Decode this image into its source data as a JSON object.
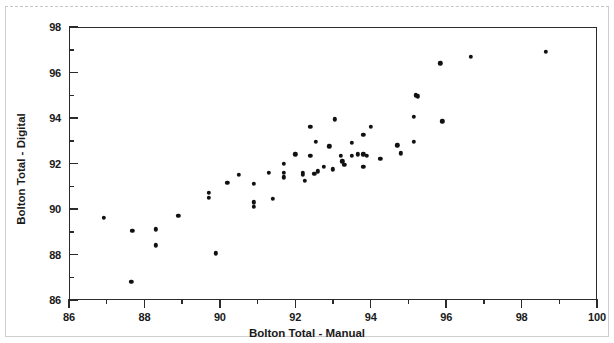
{
  "chart_data": {
    "type": "scatter",
    "title": "",
    "xlabel": "Bolton Total - Manual",
    "ylabel": "Bolton Total - Digital",
    "xlim": [
      86,
      100
    ],
    "ylim": [
      86,
      98
    ],
    "xticks": [
      86,
      88,
      90,
      92,
      94,
      96,
      98,
      100
    ],
    "yticks": [
      86,
      88,
      90,
      92,
      94,
      96,
      98
    ],
    "x_minor_ticks": [
      87,
      89,
      91,
      93,
      95,
      97,
      99
    ],
    "y_minor_ticks": [
      87,
      89,
      91,
      93,
      95,
      97
    ],
    "grid": false,
    "legend": null,
    "marker": "filled-circle",
    "marker_color": "#111111",
    "points": [
      [
        86.93,
        89.6
      ],
      [
        87.65,
        86.8
      ],
      [
        87.68,
        89.05
      ],
      [
        88.3,
        89.1
      ],
      [
        88.3,
        88.4
      ],
      [
        88.9,
        89.7
      ],
      [
        89.7,
        90.7
      ],
      [
        89.7,
        90.5
      ],
      [
        89.9,
        88.05
      ],
      [
        90.2,
        91.15
      ],
      [
        90.5,
        91.5
      ],
      [
        90.9,
        91.1
      ],
      [
        90.9,
        90.3
      ],
      [
        90.9,
        90.1
      ],
      [
        91.3,
        91.6
      ],
      [
        91.4,
        90.45
      ],
      [
        91.7,
        92.0
      ],
      [
        91.7,
        91.6
      ],
      [
        91.7,
        91.4
      ],
      [
        92.0,
        92.4
      ],
      [
        92.2,
        91.5
      ],
      [
        92.2,
        91.6
      ],
      [
        92.25,
        91.25
      ],
      [
        92.4,
        93.6
      ],
      [
        92.4,
        92.35
      ],
      [
        92.5,
        91.55
      ],
      [
        92.55,
        92.95
      ],
      [
        92.6,
        91.65
      ],
      [
        92.75,
        91.85
      ],
      [
        92.9,
        92.75
      ],
      [
        93.0,
        91.75
      ],
      [
        93.05,
        93.95
      ],
      [
        93.2,
        92.35
      ],
      [
        93.25,
        92.1
      ],
      [
        93.3,
        91.95
      ],
      [
        93.5,
        92.9
      ],
      [
        93.5,
        92.35
      ],
      [
        93.65,
        92.4
      ],
      [
        93.8,
        93.25
      ],
      [
        93.8,
        92.4
      ],
      [
        93.8,
        91.85
      ],
      [
        93.9,
        92.35
      ],
      [
        94.0,
        93.6
      ],
      [
        94.25,
        92.2
      ],
      [
        94.7,
        92.8
      ],
      [
        94.8,
        92.45
      ],
      [
        95.15,
        94.05
      ],
      [
        95.15,
        92.95
      ],
      [
        95.2,
        95.0
      ],
      [
        95.25,
        94.95
      ],
      [
        95.85,
        96.4
      ],
      [
        95.9,
        93.85
      ],
      [
        96.65,
        96.7
      ],
      [
        98.65,
        96.9
      ]
    ]
  }
}
